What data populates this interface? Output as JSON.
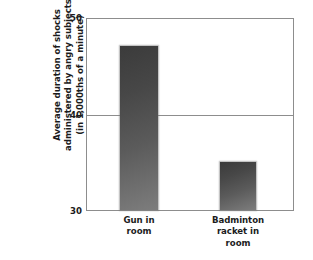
{
  "chart_data": {
    "type": "bar",
    "title": "",
    "subtitle": "",
    "xlabel": "",
    "ylabel": "Average duration of shocks administered by angry subjects (in 1,000ths of a minute)",
    "ylabel_lines": [
      "Average duration of shocks",
      "administered by angry subjects",
      "(in 1,000ths of a minute)"
    ],
    "categories": [
      "Gun in room",
      "Badminton racket in room"
    ],
    "category_lines": [
      [
        "Gun in",
        "room"
      ],
      [
        "Badminton",
        "racket in",
        "room"
      ]
    ],
    "values": [
      47.2,
      35.0
    ],
    "ylim": [
      30,
      50
    ],
    "yticks": [
      30,
      40,
      50
    ],
    "ytick_labels": [
      "30",
      "40",
      "50"
    ],
    "grid": true,
    "gridlines_at": [
      40
    ],
    "legend": null,
    "legend_position": "none",
    "bar_color": "#555555",
    "bar_color_top": "#3b3b3b",
    "bar_color_bottom": "#7d7d7d",
    "axis_color": "#8d8d8d",
    "background": "#ffffff"
  },
  "axis": {
    "ytick_50": "50",
    "ytick_40": "40",
    "ytick_30": "30"
  },
  "ylabel": {
    "line1": "Average duration of shocks",
    "line2": "administered by angry subjects",
    "line3": "(in 1,000ths of a minute)"
  },
  "xlabels": {
    "gun_line1": "Gun in",
    "gun_line2": "room",
    "badminton_line1": "Badminton",
    "badminton_line2": "racket in",
    "badminton_line3": "room"
  }
}
